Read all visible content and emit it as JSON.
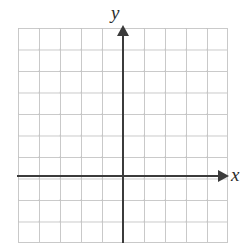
{
  "figure": {
    "name": "blank-cartesian-coordinate-plane",
    "background_color": "#ffffff"
  },
  "axes": {
    "x_label": "x",
    "y_label": "y",
    "axis_color": "#3b3b3b",
    "x_arrow_icon": "arrow-right-icon",
    "y_arrow_icon": "arrow-up-icon"
  },
  "grid": {
    "line_color": "#c9c9c9",
    "columns": 10,
    "rows": 10,
    "cell_width_px": 21,
    "cell_height_px": 21.5
  },
  "chart_data": {
    "type": "scatter",
    "title": "",
    "subtitle": "",
    "xlabel": "x",
    "ylabel": "y",
    "series": [
      {
        "name": "",
        "x": [],
        "y": []
      }
    ],
    "xlim": [
      -5,
      5
    ],
    "ylim": [
      -3,
      7
    ],
    "xticks": [],
    "yticks": [],
    "xticklabels": [],
    "yticklabels": [],
    "grid": true,
    "grid_columns": 10,
    "grid_rows": 10,
    "origin_cell_from_left": 5,
    "origin_cell_from_top": 7,
    "legend": null,
    "annotations": []
  }
}
